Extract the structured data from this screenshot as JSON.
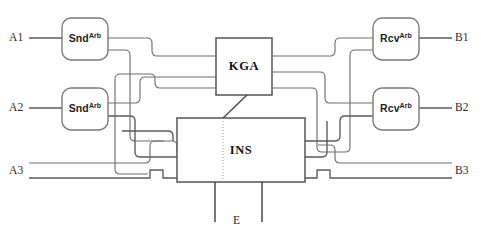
{
  "diagram": {
    "background_color": "#ffffff",
    "wire_color": "#6f6f6f",
    "box_stroke_color": "#7a7a7a",
    "text_color": "#1e1e1e",
    "blocks": [
      {
        "id": "snd1",
        "base": "Snd",
        "sup": "Arb",
        "shape": "rounded-rect"
      },
      {
        "id": "snd2",
        "base": "Snd",
        "sup": "Arb",
        "shape": "rounded-rect"
      },
      {
        "id": "rcv1",
        "base": "Rcv",
        "sup": "Arb",
        "shape": "rounded-rect"
      },
      {
        "id": "rcv2",
        "base": "Rcv",
        "sup": "Arb",
        "shape": "rounded-rect"
      },
      {
        "id": "kga",
        "base": "KGA",
        "sup": "",
        "shape": "rect"
      },
      {
        "id": "ins",
        "base": "INS",
        "sup": "",
        "shape": "rect"
      }
    ],
    "port_labels": {
      "a1": "A1",
      "a2": "A2",
      "a3": "A3",
      "b1": "B1",
      "b2": "B2",
      "b3": "B3",
      "e": "E"
    }
  }
}
